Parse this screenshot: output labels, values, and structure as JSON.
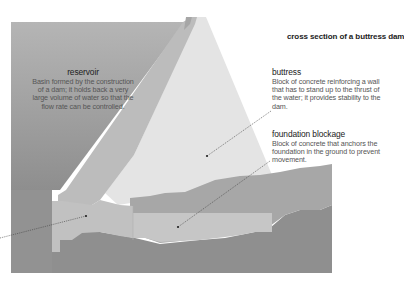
{
  "title": "cross section of a buttress dam",
  "labels": {
    "reservoir": {
      "term": "reservoir",
      "description": "Basin formed by the construction of a dam; it holds back a very large volume of water so that the flow rate can be controlled."
    },
    "buttress": {
      "term": "buttress",
      "description": "Block of concrete reinforcing a wall that has to stand up to the thrust of the water; it provides stability to the dam."
    },
    "foundation_blockage": {
      "term": "foundation blockage",
      "description": "Block of concrete that anchors the foundation in the ground to prevent movement."
    }
  },
  "colors": {
    "background": "#ffffff",
    "reservoir_water": "#9a9a9a",
    "dam_facing": "#b8b8b8",
    "buttress": "#e3e3e3",
    "foundation_concrete": "#c4c4c4",
    "ground_upper": "#a8a8a8",
    "ground_lower": "#8f8f8f",
    "leader_line": "#444444"
  }
}
